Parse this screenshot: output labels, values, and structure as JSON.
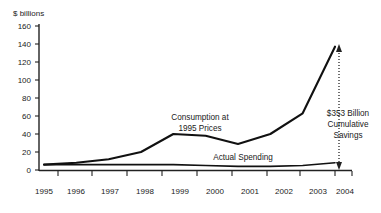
{
  "chart_data": {
    "type": "line",
    "title": "",
    "xlabel": "",
    "ylabel": "$ billions",
    "ylim": [
      0,
      160
    ],
    "ytick_values": [
      0,
      20,
      40,
      60,
      80,
      100,
      120,
      140,
      160
    ],
    "ytick_labels": [
      "0",
      "20",
      "40",
      "60",
      "80",
      "100",
      "120",
      "140",
      "160"
    ],
    "grid": false,
    "legend": "none (inline annotations)",
    "categories": [
      "1995",
      "1996",
      "1997",
      "1998",
      "1999",
      "2000",
      "2001",
      "2002",
      "2003",
      "2004"
    ],
    "series": [
      {
        "name": "Consumption at 1995 Prices",
        "values": [
          6,
          8,
          12,
          20,
          40,
          38,
          29,
          40,
          63,
          137
        ]
      },
      {
        "name": "Actual Spending",
        "values": [
          6,
          6,
          6,
          6,
          6,
          5,
          4,
          4,
          5,
          8
        ]
      }
    ],
    "annotations": [
      {
        "name": "consumption-label",
        "text_line1": "Consumption at",
        "text_line2": "1995 Prices"
      },
      {
        "name": "actual-spending-label",
        "text_line1": "Actual Spending"
      },
      {
        "name": "savings-callout",
        "text_line1": "$353 Billion",
        "text_line2": "Cumulative",
        "text_line3": "Savings"
      }
    ],
    "callout_arrow": {
      "name": "cumulative-savings-arrow",
      "style": "dotted double-headed vertical",
      "at_category": "2004",
      "from_value": 8,
      "to_value": 137
    }
  },
  "axis": {
    "y_title": "$ billions",
    "y_ticks": [
      "160",
      "140",
      "120",
      "100",
      "80",
      "60",
      "40",
      "20",
      "0"
    ],
    "x_ticks": [
      "1995",
      "1996",
      "1997",
      "1998",
      "1999",
      "2000",
      "2001",
      "2002",
      "2003",
      "2004"
    ]
  },
  "labels": {
    "consumption_line1": "Consumption at",
    "consumption_line2": "1995 Prices",
    "actual_spending": "Actual Spending",
    "savings_line1": "$353 Billion",
    "savings_line2": "Cumulative",
    "savings_line3": "Savings"
  },
  "colors": {
    "ink": "#111111",
    "background": "#ffffff"
  }
}
